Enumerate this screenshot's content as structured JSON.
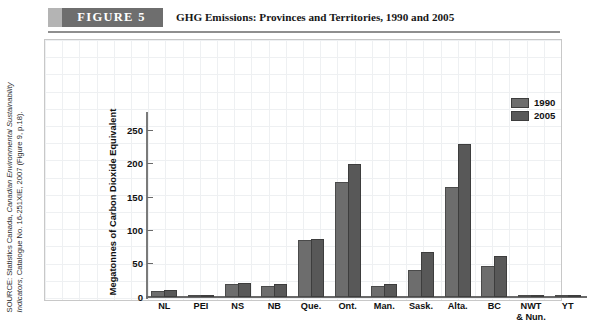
{
  "figure": {
    "badge": "FIGURE 5",
    "title": "GHG Emissions: Provinces and Territories, 1990 and 2005"
  },
  "source_note": {
    "line1": "SOURCE: Statistics Canada, ",
    "italic": "Canadian Environmental Sustainability Indicators",
    "line2": ", Catalogue No. 16-251XIE, 2007 (Figure 9, p.18)."
  },
  "colors": {
    "badge_bg": "#6e6e6e",
    "badge_accent": "#b4b4b4",
    "series_1990": "#6d6d6d",
    "series_2005": "#585858",
    "grid": "#eef0f2",
    "axis": "#6a6a6a"
  },
  "chart_data": {
    "type": "bar",
    "title": "GHG Emissions: Provinces and Territories, 1990 and 2005",
    "xlabel": "",
    "ylabel": "Megatonnes of Carbon Dioxide Equivalent",
    "ylim": [
      0,
      270
    ],
    "yticks": [
      0,
      50,
      100,
      150,
      200,
      250
    ],
    "ytick_labels": [
      "0",
      "50",
      "100",
      "150",
      "200",
      "250"
    ],
    "grid": true,
    "legend_position": "top-right",
    "categories": [
      "NL",
      "PEI",
      "NS",
      "NB",
      "Que.",
      "Ont.",
      "Man.",
      "Sask.",
      "Alta.",
      "BC",
      "NWT\n& Nun.",
      "YT"
    ],
    "category_labels": [
      "NL",
      "PEI",
      "NS",
      "NB",
      "Que.",
      "Ont.",
      "Man.",
      "Sask.",
      "Alta.",
      "BC",
      "NWT & Nun.",
      "YT"
    ],
    "series": [
      {
        "name": "1990",
        "color": "#6d6d6d",
        "values": [
          9,
          2,
          19,
          16,
          85,
          172,
          17,
          41,
          165,
          47,
          2,
          1
        ]
      },
      {
        "name": "2005",
        "color": "#585858",
        "values": [
          10,
          2,
          21,
          20,
          87,
          200,
          20,
          67,
          230,
          62,
          3,
          1
        ]
      }
    ]
  }
}
